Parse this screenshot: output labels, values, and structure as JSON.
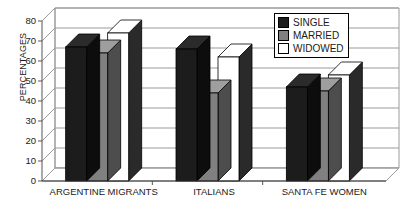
{
  "chart_data": {
    "type": "bar",
    "title": "",
    "subtitle": "",
    "xlabel": "",
    "ylabel": "PERCENTAGES",
    "ylim": [
      0,
      80
    ],
    "ytick_step": 10,
    "yticks": [
      0,
      10,
      20,
      30,
      40,
      50,
      60,
      70,
      80
    ],
    "ytick_labels": [
      "0",
      "10",
      "20",
      "30",
      "40",
      "50",
      "60",
      "70",
      "80"
    ],
    "grid": true,
    "grid_axis": "y",
    "legend_position": "top-right",
    "style": "3d-clustered-column",
    "categories": [
      "ARGENTINE MIGRANTS",
      "ITALIANS",
      "SANTA FE WOMEN"
    ],
    "series": [
      {
        "name": "SINGLE",
        "color": "#1c1c1c",
        "values": [
          67,
          66,
          47
        ]
      },
      {
        "name": "MARRIED",
        "color": "#808080",
        "values": [
          64,
          44,
          45
        ]
      },
      {
        "name": "WIDOWED",
        "color": "#ffffff",
        "values": [
          74,
          62,
          53
        ]
      }
    ]
  },
  "legend": {
    "items": [
      {
        "label": "SINGLE",
        "swatch": "#1c1c1c"
      },
      {
        "label": "MARRIED",
        "swatch": "#808080"
      },
      {
        "label": "WIDOWED",
        "swatch": "#ffffff"
      }
    ]
  },
  "axis": {
    "y_title": "PERCENTAGES",
    "y_ticks": [
      "80",
      "70",
      "60",
      "50",
      "40",
      "30",
      "20",
      "10",
      "0"
    ]
  },
  "categories": [
    "ARGENTINE MIGRANTS",
    "ITALIANS",
    "SANTA FE WOMEN"
  ]
}
